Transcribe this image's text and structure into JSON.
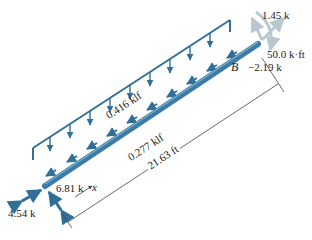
{
  "diagram": {
    "type": "free-body diagram of inclined beam",
    "colors": {
      "beam": "#3a7ca5",
      "load": "#2f6f98",
      "faded_reaction": "#b9c8cf",
      "dimension": "#444444",
      "text": "#222222"
    },
    "labels": {
      "distributed_vertical": "0.416 klf",
      "distributed_axial": "0.277 klf",
      "length": "21.63 ft",
      "end_B": "B",
      "force_B_top": "1.45 k",
      "moment_B": "50.0 k·ft",
      "force_B_axial": "−2.19 k",
      "force_A_left": "4.54 k",
      "force_A_perp": "6.81 k",
      "axis_x": "x"
    }
  }
}
